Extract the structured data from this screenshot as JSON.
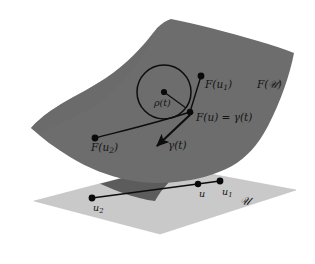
{
  "figure": {
    "kind": "mathematical-diagram",
    "background_color": "#ffffff"
  },
  "colors": {
    "surface_fill": "#6d6d6d",
    "surface_shadow_fill": "#525252",
    "plane_fill": "#c9c9c9",
    "plane_edge": "#bdbdbd",
    "ink": "#141414",
    "curve": "#0d0d0d",
    "point": "#0a0a0a"
  },
  "surface": {
    "name": "image-surface",
    "label": "F(\u0001)",
    "label_text_main": "F(",
    "label_text_script": "𝒰",
    "label_text_close": ")"
  },
  "plane": {
    "name": "parameter-domain-plane",
    "label_script": "𝒰"
  },
  "labels": {
    "f_u1": {
      "prefix": "F(u",
      "sub": "1",
      "suffix": ")"
    },
    "f_U": {
      "prefix": "F(",
      "script": "𝒰",
      "suffix": ")"
    },
    "f_u_equals_gamma": {
      "text": "F(u) = γ(t)"
    },
    "rho_t": {
      "text": "ρ(t)"
    },
    "gamma_t": {
      "text": "γ(t)"
    },
    "f_u2": {
      "prefix": "F(u",
      "sub": "2",
      "suffix": ")"
    },
    "u2": {
      "prefix": "u",
      "sub": "2"
    },
    "u": {
      "text": "u"
    },
    "u1": {
      "prefix": "u",
      "sub": "1"
    },
    "domain_U": {
      "script": "𝒰"
    }
  },
  "points": {
    "surface": [
      {
        "name": "F(u1)",
        "x": 201,
        "y": 76
      },
      {
        "name": "F(u)=gamma(t)",
        "x": 190,
        "y": 112
      },
      {
        "name": "F(u2)",
        "x": 95,
        "y": 138
      },
      {
        "name": "circle-center-rho",
        "x": 164,
        "y": 92
      }
    ],
    "plane": [
      {
        "name": "u2",
        "x": 92,
        "y": 198
      },
      {
        "name": "u",
        "x": 198,
        "y": 184
      },
      {
        "name": "u1",
        "x": 220,
        "y": 181
      }
    ]
  },
  "circle": {
    "name": "osculating-circle",
    "center_x": 164,
    "center_y": 92,
    "radius": 27,
    "radius_label": "ρ(t)"
  },
  "arrow": {
    "name": "tangent-vector-gamma",
    "from_x": 192,
    "from_y": 113,
    "to_x": 155,
    "to_y": 148,
    "label": "γ(t)"
  }
}
